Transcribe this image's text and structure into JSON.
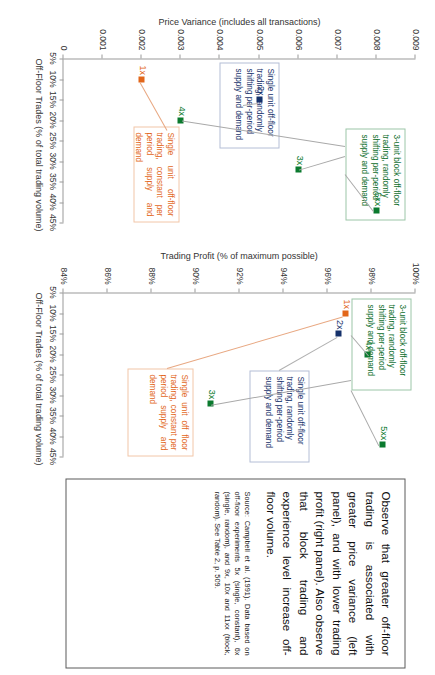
{
  "figure": {
    "orientation": "rotated-90-clockwise"
  },
  "chart_data": [
    {
      "id": "price-variance",
      "type": "scatter",
      "title": "",
      "ylabel": "Price Variance (includes all transactions)",
      "xlabel": "Off-Floor Trades (% of total trading volume)",
      "xlim": [
        5,
        45
      ],
      "ylim": [
        0,
        0.009
      ],
      "xticks": [
        "5%",
        "10%",
        "15%",
        "20%",
        "25%",
        "30%",
        "35%",
        "40%",
        "45%"
      ],
      "yticks": [
        "0",
        "0.001",
        "0.002",
        "0.003",
        "0.004",
        "0.005",
        "0.006",
        "0.007",
        "0.008",
        "0.009"
      ],
      "grid": false,
      "legend": "none",
      "points": [
        {
          "label": "1x",
          "x": 10,
          "y": 0.002,
          "color": "#e2661a",
          "series": "Single unit off-floor trading, constant per period supply and demand"
        },
        {
          "label": "2x",
          "x": 15,
          "y": 0.005,
          "color": "#15316b",
          "series": "Single unit off-floor trading, randomly shifting per-period supply and demand"
        },
        {
          "label": "4x",
          "x": 20,
          "y": 0.003,
          "color": "#0b7a2e",
          "series": "3-unit block off-floor trading, randomly shifting per-period supply and demand"
        },
        {
          "label": "3x",
          "x": 32,
          "y": 0.006,
          "color": "#0b7a2e",
          "series": "3-unit block off-floor trading, randomly shifting per-period supply and demand"
        },
        {
          "label": "5xx",
          "x": 42,
          "y": 0.008,
          "color": "#0b7a2e",
          "series": "3-unit block off-floor trading, randomly shifting per-period supply and demand"
        }
      ],
      "annotations": [
        {
          "id": "pv-green",
          "color": "#0b6d2a",
          "text": "3-unit block off-floor trading, randomly shifting per-period supply and demand"
        },
        {
          "id": "pv-navy",
          "color": "#15316b",
          "text": "Single unit off-floor trading, randomly shifting per-period supply and demand"
        },
        {
          "id": "pv-orange",
          "color": "#e2661a",
          "text": "Single unit off-floor trading, constant per period supply and demand"
        }
      ]
    },
    {
      "id": "trading-profit",
      "type": "scatter",
      "title": "",
      "ylabel": "Trading Profit (% of maximum possible)",
      "xlabel": "Off-Floor Trades (% of total trading volume)",
      "xlim": [
        5,
        45
      ],
      "ylim": [
        84,
        100
      ],
      "xticks": [
        "5%",
        "10%",
        "15%",
        "20%",
        "25%",
        "30%",
        "35%",
        "40%",
        "45%"
      ],
      "yticks": [
        "84%",
        "86%",
        "88%",
        "90%",
        "92%",
        "94%",
        "96%",
        "98%",
        "100%"
      ],
      "grid": false,
      "legend": "none",
      "points": [
        {
          "label": "1x",
          "x": 10,
          "y": 96.8,
          "color": "#e2661a",
          "series": "Single unit off floor trading, constant per period supply and demand"
        },
        {
          "label": "2x",
          "x": 15,
          "y": 96.5,
          "color": "#15316b",
          "series": "Single unit off-floor trading, randomly shifting per-period supply and demand"
        },
        {
          "label": "4x",
          "x": 20,
          "y": 97.8,
          "color": "#0b7a2e",
          "series": "3-unit block off-floor trading, randomly shifting per-period supply and demand"
        },
        {
          "label": "3x",
          "x": 32,
          "y": 90.7,
          "color": "#0b7a2e",
          "series": "3-unit block off-floor trading, randomly shifting per-period supply and demand"
        },
        {
          "label": "5xx",
          "x": 42,
          "y": 98.5,
          "color": "#0b7a2e",
          "series": "3-unit block off-floor trading, randomly shifting per-period supply and demand"
        }
      ],
      "annotations": [
        {
          "id": "tp-green",
          "color": "#0b6d2a",
          "text": "3-unit block off-floor trading, randomly shifting per-period supply and demand"
        },
        {
          "id": "tp-navy",
          "color": "#15316b",
          "text": "Single unit off-floor trading, randomly shifting per-period supply and demand"
        },
        {
          "id": "tp-orange",
          "color": "#e2661a",
          "text": "Single unit off floor trading, constant per period supply and demand"
        }
      ]
    }
  ],
  "conclusion": {
    "body": "Observe that greater off-floor trading is associated with greater price variance (left panel), and with lower trading profit (right panel).  Also observe that block trading and experience level increase off-floor volume.",
    "source": "Source:  Campbell et al. (1991).   Data based on off-floor experiments 5x (single, constant), 6x (single, random), and 9x, 10x and 11xx (block, random).  See Table 2, p. 509."
  },
  "labels": {
    "pv_ylabel": "Price Variance (includes all transactions)",
    "pv_xlabel": "Off-Floor Trades (% of total trading volume)",
    "tp_ylabel": "Trading Profit (% of maximum possible)",
    "tp_xlabel": "Off-Floor Trades (% of total trading volume)"
  },
  "colors": {
    "green": "#0b7a2e",
    "navy": "#15316b",
    "orange": "#e2661a",
    "axis": "#9a9a9a",
    "box_border": "#5a5a5a"
  }
}
